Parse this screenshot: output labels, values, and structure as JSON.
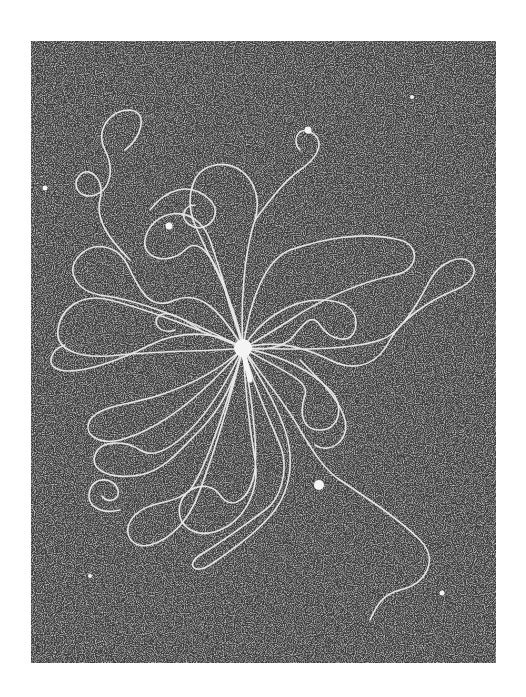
{
  "figure": {
    "type": "electron-micrograph",
    "plate": {
      "x": 31,
      "y": 41,
      "width": 465,
      "height": 622
    },
    "colors": {
      "page": "#ffffff",
      "background_dark": "#3a3a3a",
      "grain_light": "#bdbdbd",
      "strand": "#e6e6e6",
      "particle": "#f4f4f4"
    },
    "phage": {
      "head": {
        "cx": 243,
        "cy": 348,
        "r": 9
      },
      "tail": {
        "x1": 244,
        "y1": 356,
        "x2": 250,
        "y2": 380,
        "width": 5
      }
    },
    "dots": [
      {
        "cx": 45,
        "cy": 188,
        "r": 2.5
      },
      {
        "cx": 169,
        "cy": 226,
        "r": 3.5
      },
      {
        "cx": 308,
        "cy": 130,
        "r": 3.5
      },
      {
        "cx": 412,
        "cy": 97,
        "r": 2
      },
      {
        "cx": 319,
        "cy": 485,
        "r": 5
      },
      {
        "cx": 442,
        "cy": 593,
        "r": 2.5
      },
      {
        "cx": 90,
        "cy": 576,
        "r": 2
      }
    ],
    "strands": [
      "M243,348 C200,330 150,310 110,300 C80,292 60,310 58,330 C55,350 80,360 120,355 C170,350 210,352 243,348",
      "M243,348 C220,310 200,290 175,300 C150,312 140,290 130,270 C120,245 95,240 80,255 C65,270 75,290 100,295 C140,300 190,320 243,348",
      "M243,348 C230,300 220,270 210,240 C195,200 150,210 145,240 C142,260 170,265 185,250 C200,235 215,260 225,290 C232,315 238,330 243,348",
      "M243,348 C240,300 245,250 255,220 C265,185 240,160 215,165 C190,170 185,200 195,225 C210,260 235,300 243,348",
      "M243,348 C250,300 265,260 290,250 C320,240 360,230 400,240 C420,245 420,270 395,275 C360,282 320,300 290,320 C270,333 255,342 243,348",
      "M243,348 C260,320 290,300 320,300 C345,300 360,310 355,330 C350,345 330,340 320,325 C310,310 300,330 290,340 C275,350 260,350 243,348",
      "M243,348 C270,340 300,345 330,360 C360,375 380,360 390,340 C400,320 430,300 455,290 C475,282 478,270 470,262 C460,254 440,262 430,280 C420,300 400,335 380,340 C350,350 300,350 243,348",
      "M243,348 C280,355 310,370 330,390 C345,405 340,430 320,430 C300,430 300,410 305,395 C310,380 280,370 243,348",
      "M243,348 C265,380 290,410 300,430 C315,455 325,470 340,480 C370,500 400,520 420,540 C440,560 425,585 400,590 C380,595 375,610 370,620",
      "M243,348 C235,380 220,410 200,430 C180,450 165,470 140,475 C110,480 90,470 95,455 C100,440 125,440 140,450 C155,460 175,445 190,430 C210,410 228,380 243,348",
      "M243,348 C220,370 190,385 160,395 C130,405 100,405 90,420 C82,435 100,445 120,440 C150,432 190,410 243,348",
      "M243,348 C245,390 250,430 255,460 C260,490 245,520 220,530 C195,540 175,525 180,505 C185,485 210,480 220,495 C232,512 250,500 255,470 C258,440 250,390 243,348",
      "M243,348 C230,400 215,450 200,490 C190,520 170,540 150,545 C130,550 120,530 135,515 C150,500 175,505 190,490 C205,470 225,410 243,348",
      "M243,348 C255,390 270,420 280,445 C290,470 280,500 265,510 C245,525 225,540 200,555 C185,565 195,575 210,565 C235,548 260,530 275,510 C290,490 295,460 285,430 C275,400 260,380 243,348",
      "M243,348 C215,330 180,330 150,345 C120,360 80,375 60,370 C45,366 50,350 65,345",
      "M130,260 C110,240 95,220 100,200 C105,180 90,165 80,175 C70,185 80,200 95,195 C110,190 115,170 105,150 C95,130 110,110 130,110 C150,112 140,140 125,150",
      "M150,210 C165,190 190,180 210,200 C225,215 205,235 190,225 C178,217 185,205 195,205",
      "M255,220 C270,200 285,180 300,170 C315,160 325,145 315,135 C300,122 290,140 300,150",
      "M200,330 C185,320 170,310 160,315 C150,322 160,335 175,330",
      "M300,360 C320,380 340,400 345,420 C350,440 330,455 315,445",
      "M120,510 C100,515 85,505 90,490 C95,475 115,478 118,490 C120,500 108,504 102,496"
    ]
  }
}
